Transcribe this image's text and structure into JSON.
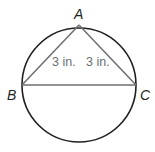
{
  "diagram": {
    "type": "inscribed-triangle",
    "circle": {
      "cx": 79,
      "cy": 85,
      "r": 57,
      "stroke": "#231f20"
    },
    "vertices": [
      {
        "label": "A",
        "x": 79,
        "y": 25
      },
      {
        "label": "B",
        "x": 22,
        "y": 85
      },
      {
        "label": "C",
        "x": 136,
        "y": 85
      }
    ],
    "measurements": [
      {
        "segment": "AB",
        "text": "3 in."
      },
      {
        "segment": "AC",
        "text": "3 in."
      }
    ],
    "triangle_stroke": "#6d6e71"
  }
}
